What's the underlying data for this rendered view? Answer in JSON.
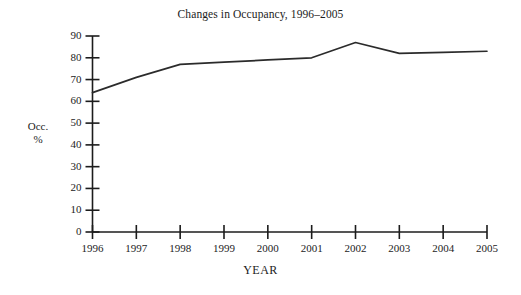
{
  "chart_data": {
    "type": "line",
    "title": "Changes in Occupancy, 1996–2005",
    "xlabel": "YEAR",
    "ylabel_line1": "Occ.",
    "ylabel_line2": "%",
    "categories": [
      "1996",
      "1997",
      "1998",
      "1999",
      "2000",
      "2001",
      "2002",
      "2003",
      "2004",
      "2005"
    ],
    "x": [
      1996,
      1997,
      1998,
      1999,
      2000,
      2001,
      2002,
      2003,
      2004,
      2005
    ],
    "values": [
      64,
      71,
      77,
      78,
      79,
      80,
      87,
      82,
      82.5,
      83
    ],
    "series": [
      {
        "name": "Occupancy %",
        "values": [
          64,
          71,
          77,
          78,
          79,
          80,
          87,
          82,
          82.5,
          83
        ]
      }
    ],
    "ylim": [
      0,
      90
    ],
    "yticks": [
      0,
      10,
      20,
      30,
      40,
      50,
      60,
      70,
      80,
      90
    ],
    "ytick_labels": [
      "0",
      "10",
      "20",
      "30",
      "40",
      "50",
      "60",
      "70",
      "80",
      "90"
    ],
    "xlim": [
      1996,
      2005
    ],
    "grid": false,
    "legend": false,
    "line_color": "#2b2b2b",
    "axis_color": "#1c1c1c",
    "background": "#ffffff",
    "markers": false
  }
}
